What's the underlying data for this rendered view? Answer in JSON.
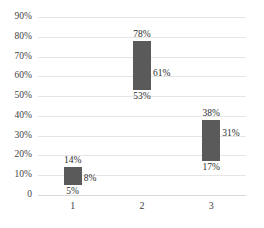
{
  "chart_data": {
    "type": "bar",
    "title": "",
    "subtitle": "",
    "xlabel": "",
    "ylabel": "",
    "categories": [
      "1",
      "2",
      "3"
    ],
    "ylim": [
      0,
      90
    ],
    "ytick_labels": [
      "0",
      "10%",
      "20%",
      "30%",
      "40%",
      "50%",
      "60%",
      "70%",
      "80%",
      "90%"
    ],
    "ytick_values": [
      0,
      10,
      20,
      30,
      40,
      50,
      60,
      70,
      80,
      90
    ],
    "grid": true,
    "legend": "none",
    "series": [
      {
        "name": "low",
        "values": [
          5,
          53,
          17
        ]
      },
      {
        "name": "mid",
        "values": [
          8,
          61,
          31
        ]
      },
      {
        "name": "high",
        "values": [
          14,
          78,
          38
        ]
      }
    ],
    "bars": [
      {
        "category": "1",
        "low": 5,
        "mid": 8,
        "high": 14,
        "low_label": "5%",
        "mid_label": "8%",
        "high_label": "14%"
      },
      {
        "category": "2",
        "low": 53,
        "mid": 61,
        "high": 78,
        "low_label": "53%",
        "mid_label": "61%",
        "high_label": "78%"
      },
      {
        "category": "3",
        "low": 17,
        "mid": 31,
        "high": 38,
        "low_label": "17%",
        "mid_label": "31%",
        "high_label": "38%"
      }
    ],
    "colors": {
      "bar_fill": "#5a5a5a",
      "gridline": "#e6e6e6",
      "axis": "#d8d8d8",
      "text": "#3f3f3f",
      "background": "#ffffff"
    }
  }
}
